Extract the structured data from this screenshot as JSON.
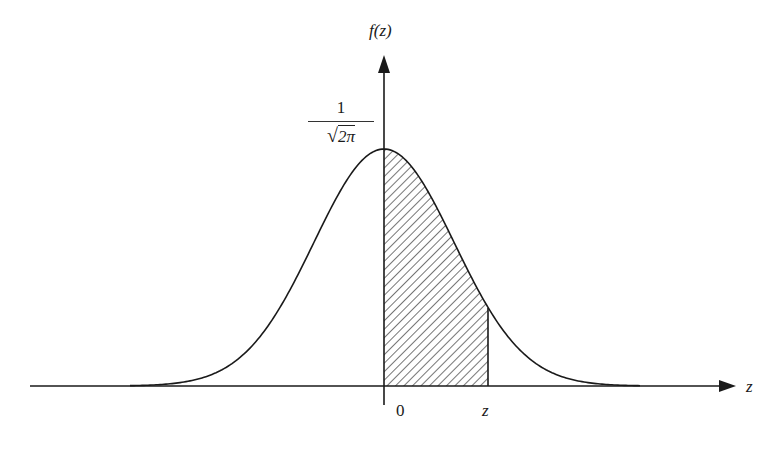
{
  "diagram": {
    "type": "normal-density-curve",
    "y_axis_label": "f(z)",
    "x_axis_label": "z",
    "peak_label": {
      "numerator": "1",
      "radical": "√",
      "radicand": "2π"
    },
    "tick_labels": {
      "origin": "0",
      "z_marker": "z"
    },
    "shaded_region": {
      "from": "0",
      "to": "z",
      "pattern": "diagonal-hatch"
    },
    "colors": {
      "line": "#1a1a1a",
      "background": "#ffffff"
    }
  },
  "chart_data": {
    "type": "area",
    "title": "",
    "xlabel": "z",
    "ylabel": "f(z)",
    "function": "standard normal pdf f(z) = (1/√(2π)) e^(-z²/2)",
    "peak_value_label": "1/√(2π)",
    "shaded_interval": [
      0,
      1.5
    ],
    "x_tick_labels": [
      "0",
      "z"
    ],
    "grid": false,
    "legend": null
  }
}
